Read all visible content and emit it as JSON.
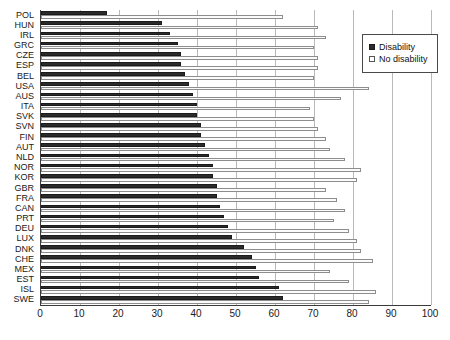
{
  "chart_data": {
    "type": "bar",
    "orientation": "horizontal",
    "title": "",
    "xlabel": "",
    "ylabel": "",
    "xlim": [
      0,
      100
    ],
    "xticks": [
      0,
      10,
      20,
      30,
      40,
      50,
      60,
      70,
      80,
      90,
      100
    ],
    "grid": true,
    "legend_position": "top-right",
    "categories": [
      "POL",
      "HUN",
      "IRL",
      "GRC",
      "CZE",
      "ESP",
      "BEL",
      "USA",
      "AUS",
      "ITA",
      "SVK",
      "SVN",
      "FIN",
      "AUT",
      "NLD",
      "NOR",
      "KOR",
      "GBR",
      "FRA",
      "CAN",
      "PRT",
      "DEU",
      "LUX",
      "DNK",
      "CHE",
      "MEX",
      "EST",
      "ISL",
      "SWE"
    ],
    "series": [
      {
        "name": "Disability",
        "color": "#2b2b2b",
        "values": [
          17,
          31,
          33,
          35,
          36,
          36,
          37,
          38,
          39,
          40,
          40,
          41,
          41,
          42,
          43,
          44,
          44,
          45,
          45,
          46,
          47,
          48,
          49,
          52,
          54,
          55,
          56,
          61,
          62
        ]
      },
      {
        "name": "No disability",
        "color": "#fbfbfb",
        "values": [
          62,
          71,
          73,
          70,
          71,
          71,
          70,
          84,
          77,
          69,
          70,
          71,
          73,
          74,
          78,
          82,
          81,
          73,
          76,
          78,
          75,
          79,
          81,
          82,
          85,
          74,
          79,
          86,
          84
        ]
      }
    ]
  },
  "legend": {
    "items": [
      {
        "label": "Disability",
        "marker": "filled-square"
      },
      {
        "label": "No disability",
        "marker": "open-square"
      }
    ]
  }
}
